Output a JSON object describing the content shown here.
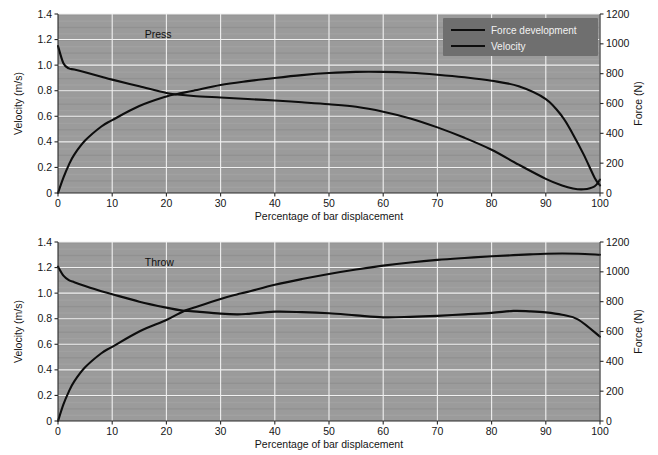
{
  "figure": {
    "title": "",
    "background_color": "#ffffff",
    "plot_background_color": "#9b9b9b",
    "grid_color": "#f0f0f0",
    "curve_color": "#0d0d0d",
    "legend_background_color": "#6f6f6f"
  },
  "legend": {
    "position": "top-right-of-first-panel",
    "entries": [
      {
        "label": "Force development"
      },
      {
        "label": "Velocity"
      }
    ]
  },
  "chart_data": [
    {
      "type": "line",
      "title": "Press",
      "annotation": "Press",
      "xlabel": "Percentage of bar displacement",
      "ylabel": "Velocity (m/s)",
      "y2label": "Force (N)",
      "xlim": [
        0,
        100
      ],
      "ylim": [
        0,
        1.4
      ],
      "y2lim": [
        0,
        1200
      ],
      "grid": true,
      "legend": [
        "Force development",
        "Velocity"
      ],
      "xticks": [
        0,
        10,
        20,
        30,
        40,
        50,
        60,
        70,
        80,
        90,
        100
      ],
      "xticklabels": [
        "0",
        "10",
        "20",
        "30",
        "40",
        "50",
        "60",
        "70",
        "80",
        "90",
        "100"
      ],
      "yticks": [
        0,
        0.2,
        0.4,
        0.6,
        0.8,
        1.0,
        1.2,
        1.4
      ],
      "yticklabels": [
        "0",
        "0.2",
        "0.4",
        "0.6",
        "0.8",
        "1.0",
        "1.2",
        "1.4"
      ],
      "y2ticks": [
        0,
        200,
        400,
        600,
        800,
        1000,
        1200
      ],
      "y2ticklabels": [
        "0",
        "200",
        "400",
        "600",
        "800",
        "1000",
        "1200"
      ],
      "x": [
        0,
        1,
        2,
        3,
        5,
        8,
        10,
        15,
        20,
        22,
        25,
        30,
        35,
        40,
        45,
        50,
        55,
        60,
        65,
        70,
        75,
        80,
        85,
        90,
        93,
        95,
        97,
        99,
        100
      ],
      "series": [
        {
          "name": "Force development",
          "axis": "right",
          "units": "N",
          "values": [
            985,
            870,
            835,
            828,
            810,
            780,
            760,
            715,
            670,
            660,
            650,
            640,
            630,
            620,
            608,
            595,
            578,
            545,
            500,
            440,
            370,
            290,
            190,
            95,
            50,
            30,
            25,
            45,
            90
          ]
        },
        {
          "name": "Velocity",
          "axis": "left",
          "units": "m/s",
          "values": [
            0.0,
            0.12,
            0.22,
            0.3,
            0.41,
            0.52,
            0.57,
            0.68,
            0.755,
            0.775,
            0.8,
            0.845,
            0.875,
            0.9,
            0.922,
            0.938,
            0.947,
            0.947,
            0.94,
            0.925,
            0.905,
            0.878,
            0.835,
            0.735,
            0.6,
            0.46,
            0.3,
            0.12,
            0.06
          ]
        }
      ]
    },
    {
      "type": "line",
      "title": "Throw",
      "annotation": "Throw",
      "xlabel": "Percentage of bar displacement",
      "ylabel": "Velocity (m/s)",
      "y2label": "Force (N)",
      "xlim": [
        0,
        100
      ],
      "ylim": [
        0,
        1.4
      ],
      "y2lim": [
        0,
        1200
      ],
      "grid": true,
      "legend": [
        "Force development",
        "Velocity"
      ],
      "xticks": [
        0,
        10,
        20,
        30,
        40,
        50,
        60,
        70,
        80,
        90,
        100
      ],
      "xticklabels": [
        "0",
        "10",
        "20",
        "30",
        "40",
        "50",
        "60",
        "70",
        "80",
        "90",
        "100"
      ],
      "yticks": [
        0,
        0.2,
        0.4,
        0.6,
        0.8,
        1.0,
        1.2,
        1.4
      ],
      "yticklabels": [
        "0",
        "0.2",
        "0.4",
        "0.6",
        "0.8",
        "1.0",
        "1.2",
        "1.4"
      ],
      "y2ticks": [
        0,
        200,
        400,
        600,
        800,
        1000,
        1200
      ],
      "y2ticklabels": [
        "0",
        "200",
        "400",
        "600",
        "800",
        "1000",
        "1200"
      ],
      "x": [
        0,
        1,
        2,
        3,
        5,
        8,
        10,
        15,
        20,
        23,
        25,
        30,
        33,
        35,
        40,
        45,
        50,
        55,
        60,
        65,
        70,
        75,
        80,
        84,
        87,
        90,
        93,
        96,
        100
      ],
      "series": [
        {
          "name": "Force development",
          "axis": "right",
          "units": "N",
          "values": [
            1035,
            975,
            945,
            930,
            905,
            870,
            850,
            800,
            760,
            740,
            735,
            720,
            715,
            718,
            733,
            730,
            722,
            708,
            695,
            698,
            705,
            715,
            725,
            738,
            735,
            728,
            712,
            680,
            565
          ]
        },
        {
          "name": "Velocity",
          "axis": "left",
          "units": "m/s",
          "values": [
            0.0,
            0.13,
            0.23,
            0.31,
            0.42,
            0.53,
            0.58,
            0.7,
            0.79,
            0.855,
            0.885,
            0.955,
            0.99,
            1.01,
            1.065,
            1.11,
            1.15,
            1.185,
            1.215,
            1.24,
            1.26,
            1.275,
            1.288,
            1.297,
            1.303,
            1.308,
            1.31,
            1.308,
            1.3
          ]
        }
      ]
    }
  ]
}
